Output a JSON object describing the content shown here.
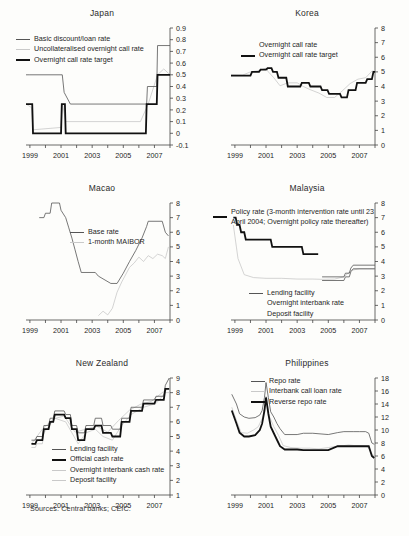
{
  "figure": {
    "source_note": "Sources: Central banks; CEIC.",
    "x_ticks": [
      "1999",
      "2001",
      "2003",
      "2005",
      "2007"
    ]
  },
  "colors": {
    "policy_thick": "#111111",
    "facility_thin": "#555555",
    "market_light": "#c2c2c2",
    "axis": "#444444",
    "background": "#fdfdfb"
  },
  "chart_data": [
    {
      "type": "line",
      "title": "Japan",
      "xlabel": "",
      "ylabel": "",
      "xlim": [
        1998.75,
        2008.0
      ],
      "ylim": [
        -0.1,
        0.9
      ],
      "y_ticks": [
        -0.1,
        0,
        0.1,
        0.2,
        0.3,
        0.4,
        0.5,
        0.6,
        0.7,
        0.8,
        0.9
      ],
      "x_ticks": [
        1999,
        2001,
        2003,
        2005,
        2007
      ],
      "grid": false,
      "legend_position": "top-left",
      "series": [
        {
          "name": "Basic discount/loan rate",
          "style": "thin",
          "x": [
            1998.75,
            1999.0,
            2001.08,
            2001.2,
            2001.6,
            2006.5,
            2006.55,
            2007.15,
            2007.2,
            2008.0
          ],
          "values": [
            0.5,
            0.5,
            0.5,
            0.35,
            0.25,
            0.25,
            0.4,
            0.4,
            0.75,
            0.75
          ]
        },
        {
          "name": "Uncollateralised overnight call rate",
          "style": "light",
          "x": [
            1998.75,
            1999.1,
            1999.2,
            2001.0,
            2001.1,
            2001.3,
            2006.1,
            2006.6,
            2007.2,
            2007.6,
            2008.0
          ],
          "values": [
            0.25,
            0.22,
            0.03,
            0.05,
            0.25,
            0.1,
            0.1,
            0.25,
            0.5,
            0.55,
            0.5
          ]
        },
        {
          "name": "Overnight call rate target",
          "style": "thick",
          "x": [
            1998.75,
            1999.15,
            1999.2,
            2001.0,
            2001.05,
            2001.25,
            2001.3,
            2006.45,
            2006.5,
            2007.15,
            2007.2,
            2008.0
          ],
          "values": [
            0.25,
            0.25,
            0.0,
            0.0,
            0.25,
            0.25,
            0.0,
            0.0,
            0.25,
            0.25,
            0.5,
            0.5
          ]
        }
      ]
    },
    {
      "type": "line",
      "title": "Korea",
      "xlabel": "",
      "ylabel": "",
      "xlim": [
        1998.75,
        2008.0
      ],
      "ylim": [
        0,
        8
      ],
      "y_ticks": [
        0,
        1,
        2,
        3,
        4,
        5,
        6,
        7,
        8
      ],
      "x_ticks": [
        1999,
        2001,
        2003,
        2005,
        2007
      ],
      "grid": false,
      "legend_position": "top-center",
      "series": [
        {
          "name": "Overnight call rate",
          "style": "light",
          "x": [
            1998.75,
            1999.5,
            2000.0,
            2000.6,
            2001.0,
            2001.15,
            2001.5,
            2001.9,
            2002.4,
            2003.0,
            2003.4,
            2003.8,
            2004.4,
            2004.9,
            2005.4,
            2005.9,
            2006.4,
            2006.9,
            2007.4,
            2007.8,
            2008.0
          ],
          "values": [
            4.8,
            4.78,
            5.0,
            5.1,
            5.25,
            5.0,
            4.6,
            4.05,
            4.25,
            4.25,
            4.0,
            3.8,
            3.55,
            3.25,
            3.25,
            3.7,
            4.2,
            4.5,
            4.6,
            5.05,
            5.05
          ]
        },
        {
          "name": "Overnight call rate target",
          "style": "thick",
          "x": [
            1998.75,
            1999.4,
            1999.5,
            2000.0,
            2000.1,
            2000.55,
            2000.65,
            2001.0,
            2001.1,
            2001.35,
            2001.45,
            2001.7,
            2001.8,
            2002.3,
            2002.4,
            2003.2,
            2003.3,
            2003.75,
            2003.85,
            2004.5,
            2004.6,
            2004.95,
            2005.05,
            2005.75,
            2005.85,
            2006.2,
            2006.3,
            2006.75,
            2006.85,
            2007.4,
            2007.5,
            2007.8,
            2007.9,
            2008.0
          ],
          "values": [
            4.75,
            4.75,
            4.75,
            4.75,
            5.0,
            5.0,
            5.15,
            5.15,
            5.25,
            5.25,
            5.0,
            5.0,
            4.6,
            4.6,
            4.0,
            4.0,
            4.25,
            4.25,
            4.0,
            4.0,
            3.75,
            3.75,
            3.5,
            3.5,
            3.25,
            3.25,
            3.75,
            3.75,
            4.25,
            4.25,
            4.5,
            4.5,
            5.0,
            5.0
          ]
        }
      ]
    },
    {
      "type": "line",
      "title": "Macao",
      "xlabel": "",
      "ylabel": "",
      "xlim": [
        1998.75,
        2008.0
      ],
      "ylim": [
        0,
        8
      ],
      "y_ticks": [
        0,
        1,
        2,
        3,
        4,
        5,
        6,
        7,
        8
      ],
      "x_ticks": [
        1999,
        2001,
        2003,
        2005,
        2007
      ],
      "grid": false,
      "legend_position": "center",
      "series": [
        {
          "name": "Base rate",
          "style": "thin",
          "x": [
            1999.6,
            1999.9,
            2000.0,
            2000.3,
            2000.4,
            2000.9,
            2001.0,
            2001.3,
            2001.5,
            2001.7,
            2001.9,
            2002.1,
            2002.3,
            2003.2,
            2003.4,
            2004.2,
            2004.6,
            2005.0,
            2005.4,
            2005.8,
            2006.2,
            2006.5,
            2006.6,
            2007.5,
            2007.7,
            2007.9
          ],
          "values": [
            7.0,
            7.0,
            7.3,
            7.3,
            8.0,
            8.0,
            7.5,
            7.0,
            6.3,
            5.6,
            4.8,
            4.0,
            3.25,
            3.25,
            3.0,
            2.5,
            2.5,
            3.2,
            4.0,
            4.75,
            5.6,
            6.4,
            6.75,
            6.75,
            6.0,
            5.75
          ]
        },
        {
          "name": "1-month MAIBOR",
          "style": "light",
          "x": [
            2003.4,
            2003.7,
            2004.0,
            2004.3,
            2004.6,
            2004.9,
            2005.1,
            2005.4,
            2005.7,
            2006.0,
            2006.3,
            2006.6,
            2006.9,
            2007.2,
            2007.5,
            2007.7,
            2007.9
          ],
          "values": [
            0.3,
            0.6,
            0.35,
            0.8,
            1.9,
            2.6,
            3.0,
            3.6,
            3.9,
            4.3,
            4.0,
            4.4,
            4.2,
            4.5,
            4.4,
            4.2,
            5.0
          ]
        }
      ]
    },
    {
      "type": "line",
      "title": "Malaysia",
      "xlabel": "",
      "ylabel": "",
      "xlim": [
        1998.75,
        2008.0
      ],
      "ylim": [
        0,
        8
      ],
      "y_ticks": [
        0,
        1,
        2,
        3,
        4,
        5,
        6,
        7,
        8
      ],
      "x_ticks": [
        1999,
        2001,
        2003,
        2005,
        2007
      ],
      "grid": false,
      "legend_position": "top-left and bottom-center",
      "series": [
        {
          "name": "Policy rate (3-month intervention rate until 23 April 2004; Overnight policy rate thereafter)",
          "style": "thick",
          "x": [
            1998.9,
            1999.05,
            1999.15,
            1999.3,
            1999.4,
            1999.6,
            1999.7,
            2001.3,
            2001.4,
            2001.9,
            2002.0,
            2003.3,
            2003.4,
            2004.35
          ],
          "values": [
            7.0,
            7.0,
            6.5,
            6.5,
            6.0,
            6.0,
            5.5,
            5.5,
            5.0,
            5.0,
            5.0,
            5.0,
            4.5,
            4.5
          ]
        },
        {
          "name": "Lending facility",
          "style": "thin",
          "x": [
            2004.6,
            2006.0,
            2006.1,
            2006.35,
            2006.45,
            2006.6,
            2008.0
          ],
          "values": [
            2.95,
            2.95,
            3.2,
            3.2,
            3.55,
            3.75,
            3.75
          ]
        },
        {
          "name": "Overnight interbank rate",
          "style": "light",
          "x": [
            1998.9,
            1999.2,
            1999.6,
            2000.2,
            2001.0,
            2002.0,
            2003.0,
            2004.0,
            2004.6,
            2005.4,
            2006.0,
            2006.5,
            2007.0,
            2007.5,
            2008.0
          ],
          "values": [
            6.5,
            4.2,
            3.1,
            2.9,
            2.85,
            2.85,
            2.8,
            2.8,
            2.78,
            2.8,
            2.95,
            3.4,
            3.5,
            3.5,
            3.5
          ]
        },
        {
          "name": "Deposit facility",
          "style": "thin",
          "x": [
            2004.6,
            2006.0,
            2006.1,
            2006.35,
            2006.45,
            2006.6,
            2008.0
          ],
          "values": [
            2.7,
            2.7,
            2.95,
            2.95,
            3.3,
            3.5,
            3.5
          ]
        }
      ]
    },
    {
      "type": "line",
      "title": "New Zealand",
      "xlabel": "",
      "ylabel": "",
      "xlim": [
        1998.75,
        2008.0
      ],
      "ylim": [
        1,
        9
      ],
      "y_ticks": [
        1,
        2,
        3,
        4,
        5,
        6,
        7,
        8,
        9
      ],
      "x_ticks": [
        1999,
        2001,
        2003,
        2005,
        2007
      ],
      "grid": false,
      "legend_position": "center",
      "series": [
        {
          "name": "Lending facility",
          "style": "thin",
          "x": [
            1999.1,
            1999.35,
            1999.45,
            1999.8,
            1999.9,
            2000.2,
            2000.3,
            2000.5,
            2000.6,
            2001.2,
            2001.3,
            2001.6,
            2001.7,
            2002.0,
            2002.1,
            2002.5,
            2002.6,
            2003.1,
            2003.2,
            2003.6,
            2003.7,
            2004.2,
            2004.3,
            2004.8,
            2004.9,
            2005.4,
            2005.5,
            2006.2,
            2006.3,
            2007.0,
            2007.1,
            2007.6,
            2007.7,
            2007.95
          ],
          "values": [
            4.75,
            4.75,
            5.0,
            5.0,
            5.75,
            5.75,
            6.25,
            6.25,
            6.75,
            6.75,
            6.5,
            6.5,
            5.75,
            5.75,
            5.25,
            5.25,
            5.75,
            5.75,
            6.25,
            6.25,
            5.75,
            5.75,
            5.5,
            5.5,
            6.25,
            6.25,
            7.0,
            7.0,
            7.5,
            7.5,
            7.75,
            7.75,
            8.5,
            9.0
          ]
        },
        {
          "name": "Official cash rate",
          "style": "thick",
          "x": [
            1999.1,
            1999.35,
            1999.45,
            1999.8,
            1999.9,
            2000.2,
            2000.3,
            2000.5,
            2000.6,
            2001.2,
            2001.3,
            2001.6,
            2001.7,
            2002.0,
            2002.1,
            2002.5,
            2002.6,
            2003.1,
            2003.2,
            2003.6,
            2003.7,
            2004.2,
            2004.3,
            2004.8,
            2004.9,
            2005.4,
            2005.5,
            2006.2,
            2006.3,
            2007.0,
            2007.1,
            2007.6,
            2007.7,
            2007.95
          ],
          "values": [
            4.5,
            4.5,
            4.75,
            4.75,
            5.5,
            5.5,
            6.0,
            6.0,
            6.5,
            6.5,
            6.25,
            6.25,
            5.5,
            5.5,
            4.75,
            4.75,
            5.5,
            5.5,
            5.75,
            5.75,
            5.25,
            5.25,
            5.0,
            5.0,
            6.0,
            6.0,
            6.75,
            6.75,
            7.25,
            7.25,
            7.5,
            7.5,
            8.25,
            8.25
          ]
        },
        {
          "name": "Overnight interbank cash rate",
          "style": "light",
          "x": [
            1999.1,
            1999.8,
            2000.5,
            2001.2,
            2001.9,
            2002.6,
            2003.3,
            2004.0,
            2004.7,
            2005.4,
            2006.1,
            2006.8,
            2007.5,
            2007.95
          ],
          "values": [
            4.5,
            5.5,
            6.2,
            6.4,
            5.3,
            5.5,
            5.7,
            5.3,
            6.1,
            6.8,
            7.2,
            7.4,
            8.0,
            8.3
          ]
        },
        {
          "name": "Deposit facility",
          "style": "light",
          "x": [
            1999.1,
            1999.35,
            1999.45,
            1999.8,
            1999.9,
            2000.6,
            2001.3,
            2001.7,
            2002.1,
            2002.6,
            2003.2,
            2003.7,
            2004.3,
            2004.9,
            2005.5,
            2006.3,
            2007.1,
            2007.7,
            2007.95
          ],
          "values": [
            4.25,
            4.25,
            4.5,
            4.5,
            5.25,
            6.25,
            6.0,
            5.25,
            4.5,
            5.25,
            5.5,
            5.0,
            4.75,
            5.75,
            6.5,
            7.0,
            7.25,
            8.0,
            8.0
          ]
        }
      ]
    },
    {
      "type": "line",
      "title": "Philippines",
      "xlabel": "",
      "ylabel": "",
      "xlim": [
        1998.75,
        2008.0
      ],
      "ylim": [
        0,
        18
      ],
      "y_ticks": [
        0,
        2,
        4,
        6,
        8,
        10,
        12,
        14,
        16,
        18
      ],
      "x_ticks": [
        1999,
        2001,
        2003,
        2005,
        2007
      ],
      "grid": false,
      "legend_position": "top-center",
      "series": [
        {
          "name": "Repo rate",
          "style": "thin",
          "x": [
            1998.8,
            1999.1,
            1999.3,
            1999.6,
            1999.9,
            2000.3,
            2000.6,
            2000.75,
            2000.9,
            2001.0,
            2001.15,
            2001.3,
            2001.5,
            2001.7,
            2001.9,
            2002.2,
            2003.0,
            2003.4,
            2004.0,
            2005.0,
            2005.6,
            2006.0,
            2006.6,
            2007.0,
            2007.4,
            2007.6,
            2007.8,
            2007.95
          ],
          "values": [
            15.5,
            14.0,
            12.5,
            12.0,
            11.8,
            11.9,
            12.3,
            13.0,
            15.0,
            17.3,
            15.0,
            12.8,
            12.0,
            11.0,
            10.2,
            9.3,
            9.3,
            9.5,
            9.5,
            9.3,
            9.6,
            9.75,
            9.75,
            9.75,
            9.75,
            9.5,
            8.0,
            7.8
          ]
        },
        {
          "name": "Interbank call loan rate",
          "style": "light",
          "x": [
            1998.8,
            1999.1,
            1999.4,
            1999.8,
            2000.2,
            2000.5,
            2000.8,
            2001.0,
            2001.2,
            2001.5,
            2001.8,
            2002.1,
            2002.6,
            2003.2,
            2003.8,
            2004.4,
            2005.0,
            2005.5,
            2006.0,
            2006.3,
            2006.7,
            2007.1,
            2007.5,
            2007.8,
            2007.95
          ],
          "values": [
            13.5,
            11.5,
            9.6,
            9.5,
            10.0,
            10.5,
            12.0,
            15.2,
            12.2,
            10.5,
            9.2,
            7.6,
            7.3,
            7.2,
            7.2,
            7.1,
            7.3,
            7.5,
            7.6,
            7.7,
            7.6,
            7.6,
            7.5,
            6.4,
            5.9
          ]
        },
        {
          "name": "Reverse repo rate",
          "style": "thick",
          "x": [
            1998.8,
            1999.1,
            1999.3,
            1999.6,
            1999.9,
            2000.3,
            2000.6,
            2000.75,
            2000.9,
            2001.0,
            2001.15,
            2001.3,
            2001.5,
            2001.7,
            2001.9,
            2002.2,
            2003.0,
            2003.4,
            2004.0,
            2005.0,
            2005.6,
            2006.0,
            2006.6,
            2007.0,
            2007.4,
            2007.6,
            2007.8,
            2007.95
          ],
          "values": [
            13.0,
            11.0,
            9.6,
            9.0,
            9.0,
            9.2,
            10.0,
            11.0,
            13.0,
            15.0,
            12.5,
            10.5,
            9.5,
            8.5,
            7.5,
            7.0,
            7.0,
            6.9,
            6.9,
            6.9,
            7.5,
            7.5,
            7.5,
            7.5,
            7.5,
            7.5,
            6.0,
            5.7
          ]
        }
      ]
    }
  ]
}
